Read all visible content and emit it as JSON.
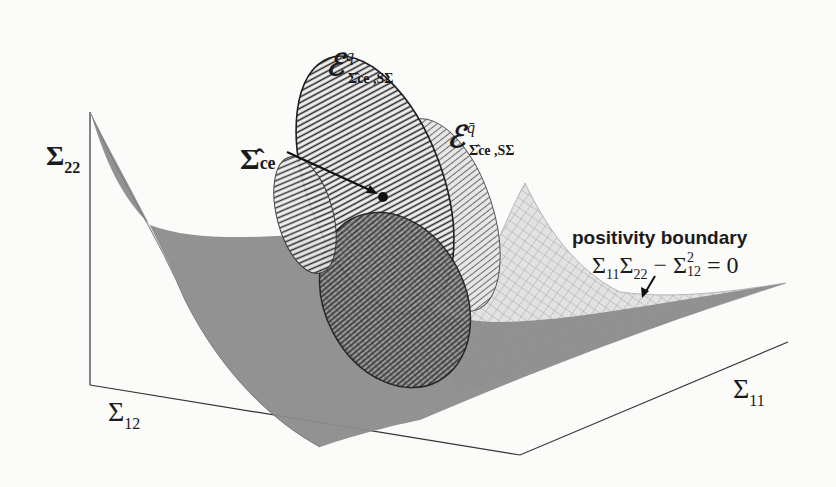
{
  "figure": {
    "type": "3d-diagram",
    "colors": {
      "background": "#fbfbfa",
      "cone_dark": "#8a8a8a",
      "cone_light_mesh": "#b5b5b5",
      "ellipsoid_lines": "#222222",
      "axis": "#333333"
    }
  },
  "axes": {
    "vertical": {
      "symbol": "Σ",
      "subscript": "22"
    },
    "left_depth": {
      "symbol": "Σ",
      "subscript": "12"
    },
    "right_depth": {
      "symbol": "Σ",
      "subscript": "11"
    }
  },
  "labels": {
    "ellipsoid_q": {
      "main": "ℰ",
      "superscript": "q",
      "subscript": "Σ̂ce ,SΣ"
    },
    "ellipsoid_qbar": {
      "main": "ℰ",
      "superscript": "q̄",
      "subscript": "Σ̂ce ,SΣ"
    },
    "center_point": {
      "main": "Σ̂",
      "subscript": "ce"
    },
    "boundary_title": "positivity boundary",
    "boundary_equation": {
      "t1": "Σ",
      "t1s": "11",
      "t2": "Σ",
      "t2s": "22",
      "minus": " − ",
      "t3": "Σ",
      "t3sup": "2",
      "t3s": "12",
      "rhs": " = 0"
    }
  }
}
